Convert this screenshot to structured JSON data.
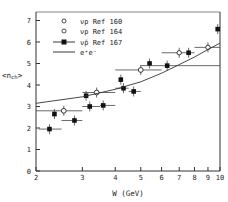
{
  "chart_data": {
    "type": "scatter",
    "title": "",
    "xlabel": "W (GeV)",
    "ylabel": "<n_ch>",
    "xscale": "log",
    "xlim": [
      2,
      10
    ],
    "ylim": [
      0,
      7.5
    ],
    "xticks": [
      2,
      3,
      4,
      5,
      6,
      7,
      8,
      9,
      10
    ],
    "yticks": [
      0,
      1,
      2,
      3,
      4,
      5,
      6,
      7
    ],
    "grid": false,
    "legend_position": "upper left",
    "series": [
      {
        "name": "νp Ref 160",
        "marker": "open-circle",
        "points": [
          {
            "x": 2.55,
            "y": 2.8,
            "xerr": [
              2.0,
              3.0
            ]
          },
          {
            "x": 3.4,
            "y": 3.65,
            "xerr": [
              3.0,
              4.0
            ]
          },
          {
            "x": 5.0,
            "y": 4.7,
            "xerr": [
              4.0,
              6.0
            ]
          }
        ]
      },
      {
        "name": "νp Ref 164",
        "marker": "open-circle-small",
        "points": [
          {
            "x": 7.0,
            "y": 5.5,
            "xerr": [
              6.0,
              8.0
            ]
          },
          {
            "x": 9.0,
            "y": 5.75,
            "xerr": [
              8.0,
              10.0
            ]
          }
        ]
      },
      {
        "name": "ν̄p Ref 167",
        "marker": "filled-square",
        "points": [
          {
            "x": 2.25,
            "y": 1.95,
            "xerr": [
              2.05,
              2.5
            ]
          },
          {
            "x": 2.35,
            "y": 2.65
          },
          {
            "x": 2.8,
            "y": 2.35,
            "xerr": [
              2.5,
              3.0
            ]
          },
          {
            "x": 3.1,
            "y": 3.5
          },
          {
            "x": 3.2,
            "y": 3.0,
            "xerr": [
              3.0,
              3.5
            ]
          },
          {
            "x": 3.6,
            "y": 3.05,
            "xerr": [
              3.5,
              4.0
            ]
          },
          {
            "x": 4.2,
            "y": 4.25
          },
          {
            "x": 4.3,
            "y": 3.85,
            "xerr": [
              4.0,
              4.5
            ]
          },
          {
            "x": 4.7,
            "y": 3.7,
            "xerr": [
              4.5,
              5.0
            ]
          },
          {
            "x": 5.4,
            "y": 5.0
          },
          {
            "x": 6.3,
            "y": 4.9,
            "xerr": [
              5.0,
              10.0
            ]
          },
          {
            "x": 7.6,
            "y": 5.5
          },
          {
            "x": 9.8,
            "y": 6.6
          }
        ]
      },
      {
        "name": "e+e-",
        "marker": "line",
        "points": [
          {
            "x": 2.0,
            "y": 3.15
          },
          {
            "x": 3.0,
            "y": 3.45
          },
          {
            "x": 4.0,
            "y": 3.8
          },
          {
            "x": 5.0,
            "y": 4.15
          },
          {
            "x": 6.0,
            "y": 4.55
          },
          {
            "x": 7.0,
            "y": 4.95
          },
          {
            "x": 8.0,
            "y": 5.3
          },
          {
            "x": 9.0,
            "y": 5.65
          },
          {
            "x": 10.0,
            "y": 5.95
          }
        ]
      }
    ]
  },
  "legend": {
    "items": [
      {
        "label": "νp  Ref 160"
      },
      {
        "label": "νp  Ref 164"
      },
      {
        "label": "ν̄p  Ref 167"
      },
      {
        "label": "e⁺e⁻"
      }
    ]
  },
  "axes": {
    "xlabel": "W (GeV)",
    "ylabel": "<nch>",
    "xtick_labels": [
      "2",
      "3",
      "4",
      "5",
      "6",
      "7",
      "8",
      "9",
      "10"
    ],
    "ytick_labels": [
      "0",
      "1",
      "2",
      "3",
      "4",
      "5",
      "6",
      "7"
    ]
  }
}
